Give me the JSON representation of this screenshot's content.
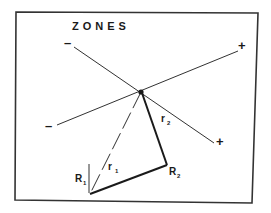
{
  "diagram": {
    "title": "ZONES",
    "axes": [
      {
        "name": "axis-a",
        "neg_label": "–",
        "pos_label": "+"
      },
      {
        "name": "axis-b",
        "neg_label": "–",
        "pos_label": "+"
      }
    ],
    "points": {
      "origin": {
        "label": ""
      },
      "R1": {
        "label": "R",
        "subscript": "1"
      },
      "R2": {
        "label": "R",
        "subscript": "2"
      }
    },
    "segments": {
      "r1": {
        "label": "r",
        "subscript": "1",
        "style": "dashed"
      },
      "r2": {
        "label": "r",
        "subscript": "2",
        "style": "solid-thick"
      }
    },
    "colors": {
      "ink": "#1a1a1a",
      "frame": "#333333",
      "background": "#ffffff"
    }
  }
}
